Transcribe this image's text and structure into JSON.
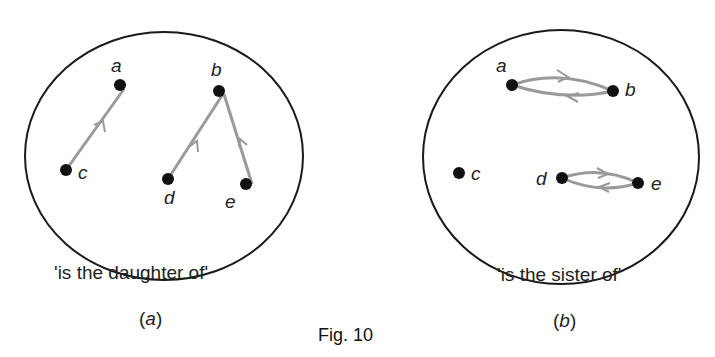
{
  "figure": {
    "title": "Fig. 10",
    "panels": [
      {
        "id": "a",
        "subcaption": "(a)",
        "sub_letter": "a",
        "caption": "'is the daughter of'",
        "nodes": [
          {
            "label": "a",
            "x": 120,
            "y": 85
          },
          {
            "label": "b",
            "x": 219,
            "y": 91
          },
          {
            "label": "c",
            "x": 66,
            "y": 170
          },
          {
            "label": "d",
            "x": 168,
            "y": 179
          },
          {
            "label": "e",
            "x": 246,
            "y": 184
          }
        ],
        "edges": [
          {
            "from": "c",
            "to": "a"
          },
          {
            "from": "d",
            "to": "b"
          },
          {
            "from": "e",
            "to": "b"
          }
        ]
      },
      {
        "id": "b",
        "subcaption": "(b)",
        "sub_letter": "b",
        "caption": "'is the sister of'",
        "nodes": [
          {
            "label": "a",
            "x": 512,
            "y": 85
          },
          {
            "label": "b",
            "x": 613,
            "y": 91
          },
          {
            "label": "c",
            "x": 459,
            "y": 173
          },
          {
            "label": "d",
            "x": 562,
            "y": 178
          },
          {
            "label": "e",
            "x": 638,
            "y": 183
          }
        ],
        "edges": [
          {
            "from": "a",
            "to": "b"
          },
          {
            "from": "b",
            "to": "a"
          },
          {
            "from": "d",
            "to": "e"
          },
          {
            "from": "e",
            "to": "d"
          }
        ]
      }
    ],
    "colors": {
      "outline": "#1a1a1a",
      "edge": "#9a9a9a",
      "node": "#111111"
    }
  }
}
